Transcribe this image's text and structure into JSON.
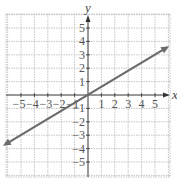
{
  "chart_data": {
    "type": "line",
    "title": "",
    "xlabel": "x",
    "ylabel": "y",
    "xlim": [
      -6.2,
      6
    ],
    "ylim": [
      -6.2,
      6
    ],
    "grid": true,
    "x_ticks": [
      -5,
      -4,
      -3,
      -2,
      -1,
      1,
      2,
      3,
      4,
      5
    ],
    "y_ticks": [
      5,
      4,
      3,
      2,
      1,
      -1,
      -2,
      -3,
      -4,
      -5
    ],
    "x_tick_labels": [
      "−5",
      "−4",
      "−3",
      "−2",
      "−1",
      "1",
      "2",
      "3",
      "4",
      "5"
    ],
    "y_tick_labels": [
      "5",
      "4",
      "3",
      "2",
      "1",
      "−1",
      "−2",
      "−3",
      "−4",
      "−5"
    ],
    "series": [
      {
        "name": "line",
        "equation": "y = (3/5)x",
        "slope": 0.6,
        "intercept": 0,
        "x": [
          -6.2,
          0,
          5,
          5.9
        ],
        "y": [
          -3.7,
          0,
          3,
          3.55
        ],
        "arrows": "both"
      }
    ]
  },
  "colors": {
    "grid": "#b8b8b8",
    "axis": "#333333",
    "line": "#6a6a6a",
    "text": "#555555"
  }
}
